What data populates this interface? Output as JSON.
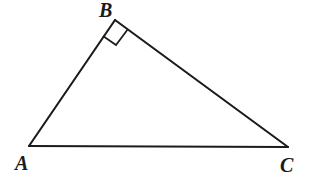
{
  "figure": {
    "kind": "geometry-diagram",
    "shape": "right-triangle",
    "background_color": "#ffffff",
    "stroke_color": "#1b1b1b",
    "stroke_width": 2.1,
    "canvas": {
      "width": 313,
      "height": 189
    },
    "vertices": [
      {
        "name": "A",
        "label": "A",
        "x": 29,
        "y": 146,
        "angle_type": "acute"
      },
      {
        "name": "B",
        "label": "B",
        "x": 115,
        "y": 20,
        "angle_type": "right"
      },
      {
        "name": "C",
        "label": "C",
        "x": 288,
        "y": 147,
        "angle_type": "acute"
      }
    ],
    "edges": [
      {
        "name": "AB",
        "from": "A",
        "to": "B"
      },
      {
        "name": "BC",
        "from": "B",
        "to": "C"
      },
      {
        "name": "CA",
        "from": "C",
        "to": "A"
      }
    ],
    "right_angle_marker": {
      "at_vertex": "B",
      "points": "115,20 103,36 116,45 128,29",
      "filled": false
    },
    "labels": {
      "A": {
        "text": "A",
        "x": 15,
        "y": 153
      },
      "B": {
        "text": "B",
        "x": 99,
        "y": 0
      },
      "C": {
        "text": "C",
        "x": 280,
        "y": 155
      }
    }
  }
}
